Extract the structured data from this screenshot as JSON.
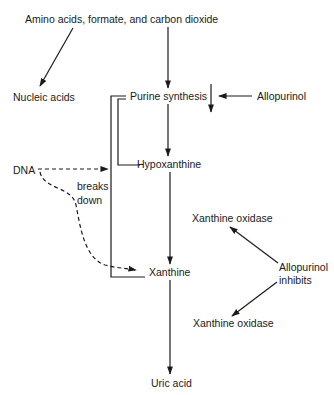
{
  "diagram": {
    "nodes": {
      "sources": "Amino acids, formate, and carbon dioxide",
      "nucleic_acids": "Nucleic acids",
      "purine_synthesis": "Purine synthesis",
      "allopurinol": "Allopurinol",
      "dna": "DNA",
      "breaks_down_1": "breaks",
      "breaks_down_2": "down",
      "hypoxanthine": "Hypoxanthine",
      "xanthine_oxidase_top": "Xanthine oxidase",
      "xanthine": "Xanthine",
      "allopurinol_inhibits_1": "Allopurinol",
      "allopurinol_inhibits_2": "inhibits",
      "xanthine_oxidase_bottom": "Xanthine oxidase",
      "uric_acid": "Uric acid"
    },
    "edges": [
      {
        "from": "sources",
        "to": "nucleic_acids",
        "style": "solid"
      },
      {
        "from": "sources",
        "to": "purine_synthesis",
        "style": "solid"
      },
      {
        "from": "allopurinol",
        "to": "purine_synthesis",
        "style": "solid",
        "note": "inhibits (down arrow)"
      },
      {
        "from": "purine_synthesis",
        "to": "hypoxanthine",
        "style": "solid"
      },
      {
        "from": "hypoxanthine",
        "to": "xanthine",
        "style": "solid"
      },
      {
        "from": "xanthine",
        "to": "uric_acid",
        "style": "solid"
      },
      {
        "from": "dna",
        "to": "hypoxanthine",
        "style": "dashed",
        "label": "breaks down"
      },
      {
        "from": "dna",
        "to": "xanthine",
        "style": "dashed"
      },
      {
        "from": "allopurinol_inhibits",
        "to": "xanthine_oxidase_top",
        "style": "solid"
      },
      {
        "from": "allopurinol_inhibits",
        "to": "xanthine_oxidase_bottom",
        "style": "solid"
      }
    ]
  }
}
